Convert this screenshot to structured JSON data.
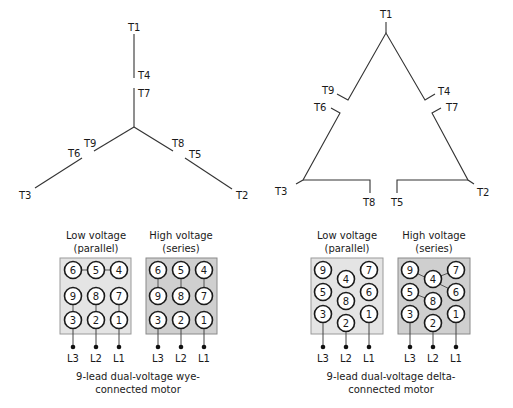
{
  "wye_diagram": {
    "terminal_labels": {
      "T1": "T1",
      "T4": "T4",
      "T7": "T7",
      "T9": "T9",
      "T6": "T6",
      "T3": "T3",
      "T8": "T8",
      "T5": "T5",
      "T2": "T2"
    }
  },
  "delta_diagram": {
    "terminal_labels": {
      "T1": "T1",
      "T9": "T9",
      "T4": "T4",
      "T6": "T6",
      "T7": "T7",
      "T3": "T3",
      "T2": "T2",
      "T8": "T8",
      "T5": "T5"
    }
  },
  "wye_boxes": {
    "low": {
      "title_line1": "Low voltage",
      "title_line2": "(parallel)",
      "terminals": [
        "6",
        "5",
        "4",
        "9",
        "8",
        "7",
        "3",
        "2",
        "1"
      ]
    },
    "high": {
      "title_line1": "High voltage",
      "title_line2": "(series)",
      "terminals": [
        "6",
        "5",
        "4",
        "9",
        "8",
        "7",
        "3",
        "2",
        "1"
      ]
    },
    "leads": [
      "L3",
      "L2",
      "L1"
    ],
    "caption_line1": "9-lead dual-voltage wye-",
    "caption_line2": "connected motor"
  },
  "delta_boxes": {
    "low": {
      "title_line1": "Low voltage",
      "title_line2": "(parallel)",
      "terminals": [
        "9",
        "4",
        "7",
        "5",
        "8",
        "6",
        "3",
        "2",
        "1"
      ]
    },
    "high": {
      "title_line1": "High voltage",
      "title_line2": "(series)",
      "terminals": [
        "9",
        "4",
        "7",
        "5",
        "8",
        "6",
        "3",
        "2",
        "1"
      ]
    },
    "leads": [
      "L3",
      "L2",
      "L1"
    ],
    "caption_line1": "9-lead dual-voltage delta-",
    "caption_line2": "connected motor"
  },
  "colors": {
    "line": "#333333",
    "low_box_fill": "#e4e4e4",
    "high_box_fill": "#cfcfcf",
    "text": "#1a1a1a"
  }
}
